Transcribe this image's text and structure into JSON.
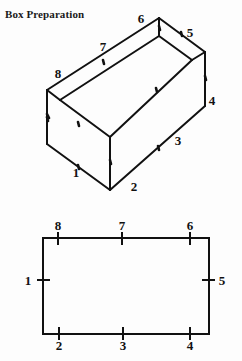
{
  "title": "Box Preparation",
  "figures": {
    "box": {
      "name": "open-box-3d",
      "labels": [
        {
          "id": "box-label-1",
          "text": "1",
          "x": 76,
          "y": 172
        },
        {
          "id": "box-label-2",
          "text": "2",
          "x": 134,
          "y": 186
        },
        {
          "id": "box-label-3",
          "text": "3",
          "x": 178,
          "y": 140
        },
        {
          "id": "box-label-4",
          "text": "4",
          "x": 212,
          "y": 100
        },
        {
          "id": "box-label-5",
          "text": "5",
          "x": 190,
          "y": 32
        },
        {
          "id": "box-label-6",
          "text": "6",
          "x": 141,
          "y": 18
        },
        {
          "id": "box-label-7",
          "text": "7",
          "x": 103,
          "y": 46
        },
        {
          "id": "box-label-8",
          "text": "8",
          "x": 58,
          "y": 73
        }
      ]
    },
    "rectangle": {
      "name": "flat-box-net",
      "labels": [
        {
          "id": "rect-label-8",
          "text": "8",
          "x": 58,
          "y": 225
        },
        {
          "id": "rect-label-7",
          "text": "7",
          "x": 122,
          "y": 225
        },
        {
          "id": "rect-label-6",
          "text": "6",
          "x": 190,
          "y": 225
        },
        {
          "id": "rect-label-1",
          "text": "1",
          "x": 28,
          "y": 280
        },
        {
          "id": "rect-label-5",
          "text": "5",
          "x": 222,
          "y": 280
        },
        {
          "id": "rect-label-2",
          "text": "2",
          "x": 59,
          "y": 345
        },
        {
          "id": "rect-label-3",
          "text": "3",
          "x": 123,
          "y": 345
        },
        {
          "id": "rect-label-4",
          "text": "4",
          "x": 190,
          "y": 345
        }
      ]
    }
  },
  "colors": {
    "ink": "#111111",
    "paper": "#fdfdfd"
  }
}
